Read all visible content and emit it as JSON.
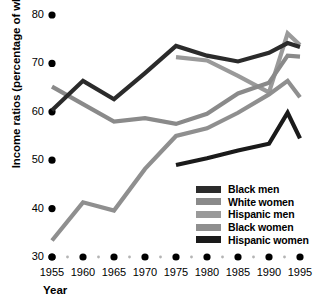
{
  "chart_data": {
    "type": "line",
    "title": "",
    "xlabel": "Year",
    "ylabel": "Income ratios (percentage of white men)",
    "xlim": [
      1955,
      1995
    ],
    "ylim": [
      30,
      80
    ],
    "yticks": [
      30,
      40,
      50,
      60,
      70,
      80
    ],
    "xticks": [
      1955,
      1960,
      1965,
      1970,
      1975,
      1980,
      1985,
      1990,
      1995
    ],
    "minor_xticks": [
      1957.5,
      1962.5,
      1967.5,
      1972.5,
      1977.5,
      1982.5,
      1987.5,
      1992.5
    ],
    "grid": false,
    "legend_position": "lower-right",
    "series": [
      {
        "name": "Black men",
        "color": "#2b2b2b",
        "x": [
          1955,
          1960,
          1965,
          1970,
          1975,
          1980,
          1985,
          1990,
          1993,
          1995
        ],
        "values": [
          60.3,
          66.4,
          62.6,
          68.0,
          73.6,
          71.6,
          70.4,
          72.2,
          74.2,
          73.4
        ]
      },
      {
        "name": "White women",
        "color": "#8a8a8a",
        "x": [
          1955,
          1960,
          1965,
          1970,
          1975,
          1980,
          1985,
          1990,
          1993,
          1995
        ],
        "values": [
          65.2,
          61.6,
          58.0,
          58.7,
          57.5,
          59.6,
          63.8,
          66.0,
          71.6,
          71.4
        ]
      },
      {
        "name": "Hispanic men",
        "color": "#9a9a9a",
        "x": [
          1975,
          1980,
          1985,
          1990,
          1993,
          1995
        ],
        "values": [
          71.3,
          70.6,
          67.4,
          64.0,
          76.2,
          73.8
        ]
      },
      {
        "name": "Black women",
        "color": "#8f8f8f",
        "x": [
          1955,
          1960,
          1965,
          1970,
          1975,
          1980,
          1985,
          1990,
          1993,
          1995
        ],
        "values": [
          33.4,
          41.3,
          39.6,
          48.2,
          55.0,
          56.6,
          59.8,
          63.6,
          66.4,
          63.0
        ]
      },
      {
        "name": "Hispanic women",
        "color": "#1a1a1a",
        "x": [
          1975,
          1980,
          1985,
          1990,
          1993,
          1995
        ],
        "values": [
          49.0,
          50.4,
          52.0,
          53.4,
          59.8,
          54.5
        ]
      }
    ]
  },
  "legend": {
    "items": [
      {
        "label": "Black men",
        "color": "#2b2b2b"
      },
      {
        "label": "White women",
        "color": "#8a8a8a"
      },
      {
        "label": "Hispanic men",
        "color": "#9a9a9a"
      },
      {
        "label": "Black women",
        "color": "#8f8f8f"
      },
      {
        "label": "Hispanic women",
        "color": "#1a1a1a"
      }
    ]
  },
  "axes": {
    "ylabel": "Income ratios (percentage of white men)",
    "xlabel": "Year"
  }
}
